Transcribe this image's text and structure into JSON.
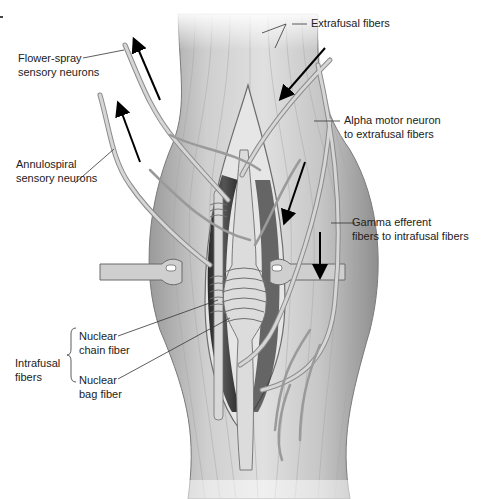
{
  "diagram": {
    "colors": {
      "background": "#ffffff",
      "muscle": "#c8c8c8",
      "muscle_dark": "#8a8a8a",
      "nerve": "#b5b5b5",
      "arrow": "#000000",
      "label_text": "#222222",
      "leader_line": "#333333"
    },
    "labels": {
      "extrafusal": "Extrafusal fibers",
      "flower_spray_1": "Flower-spray",
      "flower_spray_2": "sensory neurons",
      "alpha_1": "Alpha motor neuron",
      "alpha_2": "to extrafusal fibers",
      "annulospiral_1": "Annulospiral",
      "annulospiral_2": "sensory neurons",
      "gamma_1": "Gamma efferent",
      "gamma_2": "fibers to intrafusal fibers",
      "chain_1": "Nuclear",
      "chain_2": "chain fiber",
      "intrafusal_1": "Intrafusal",
      "intrafusal_2": "fibers",
      "bag_1": "Nuclear",
      "bag_2": "bag fiber"
    },
    "arrows": [
      {
        "name": "flower-spray-afferent-arrow",
        "direction": "up"
      },
      {
        "name": "annulospiral-afferent-arrow",
        "direction": "up"
      },
      {
        "name": "alpha-efferent-arrow",
        "direction": "down-left"
      },
      {
        "name": "gamma-efferent-arrow-1",
        "direction": "down-left"
      },
      {
        "name": "gamma-efferent-arrow-2",
        "direction": "down"
      }
    ]
  }
}
